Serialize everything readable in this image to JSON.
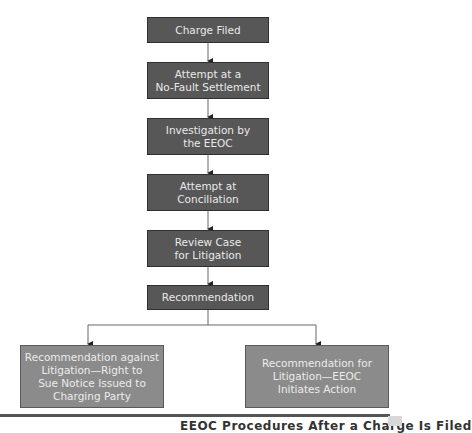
{
  "diagram": {
    "type": "flowchart",
    "steps": [
      {
        "id": "charge-filed",
        "label": "Charge Filed"
      },
      {
        "id": "no-fault-settlement",
        "label": "Attempt at a\nNo-Fault Settlement"
      },
      {
        "id": "investigation",
        "label": "Investigation by\nthe EEOC"
      },
      {
        "id": "conciliation",
        "label": "Attempt at\nConciliation"
      },
      {
        "id": "review-case",
        "label": "Review Case\nfor Litigation"
      },
      {
        "id": "recommendation",
        "label": "Recommendation"
      }
    ],
    "outcomes": [
      {
        "id": "against-litigation",
        "label": "Recommendation against\nLitigation—Right to\nSue Notice Issued to\nCharging Party"
      },
      {
        "id": "for-litigation",
        "label": "Recommendation for\nLitigation—EEOC\nInitiates Action"
      }
    ],
    "edges": [
      [
        "charge-filed",
        "no-fault-settlement"
      ],
      [
        "no-fault-settlement",
        "investigation"
      ],
      [
        "investigation",
        "conciliation"
      ],
      [
        "conciliation",
        "review-case"
      ],
      [
        "review-case",
        "recommendation"
      ],
      [
        "recommendation",
        "against-litigation"
      ],
      [
        "recommendation",
        "for-litigation"
      ]
    ],
    "caption": "EEOC Procedures After a Charge Is Filed",
    "colors": {
      "step_fill": "#575757",
      "outcome_fill": "#8b8b8b",
      "text": "#e9e9e9",
      "connector": "#444444"
    }
  }
}
